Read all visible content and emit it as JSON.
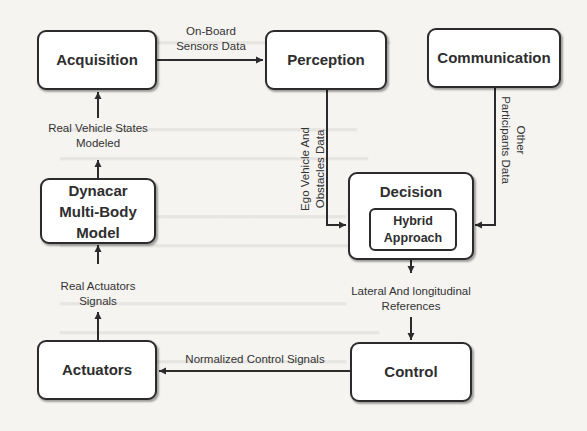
{
  "diagram": {
    "nodes": {
      "acquisition": "Acquisition",
      "perception": "Perception",
      "communication": "Communication",
      "dynacar_line1": "Dynacar",
      "dynacar_line2": "Multi-Body",
      "dynacar_line3": "Model",
      "decision": "Decision",
      "hybrid_line1": "Hybrid",
      "hybrid_line2": "Approach",
      "actuators": "Actuators",
      "control": "Control"
    },
    "edges": {
      "acq_to_perc_line1": "On-Board",
      "acq_to_perc_line2": "Sensors Data",
      "perc_to_dec_line1": "Ego Vehicle And",
      "perc_to_dec_line2": "Obstacles Data",
      "comm_to_dec_line1": "Other",
      "comm_to_dec_line2": "Participants Data",
      "dec_to_ctrl_line1": "Lateral And longitudinal",
      "dec_to_ctrl_line2": "References",
      "ctrl_to_act": "Normalized Control Signals",
      "act_to_dyn_line1": "Real Actuators",
      "act_to_dyn_line2": "Signals",
      "dyn_to_acq_line1": "Real Vehicle States",
      "dyn_to_acq_line2": "Modeled"
    },
    "colors": {
      "stroke": "#2b2b2b",
      "box_fill": "#ffffff",
      "background": "#f5f4f1"
    }
  }
}
